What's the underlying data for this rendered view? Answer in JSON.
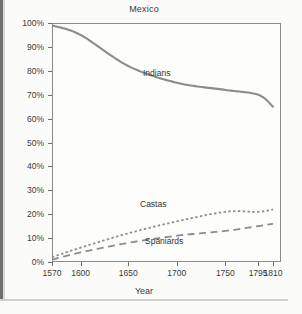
{
  "chart_data": {
    "type": "line",
    "title": "Mexico",
    "xlabel": "Year",
    "ylabel": "",
    "grid": false,
    "legend_position": "inline-annotations",
    "ylim": [
      0,
      100
    ],
    "ytick_labels": [
      "0%",
      "10%",
      "20%",
      "30%",
      "40%",
      "50%",
      "60%",
      "70%",
      "80%",
      "90%",
      "100%"
    ],
    "ytick_values": [
      0,
      10,
      20,
      30,
      40,
      50,
      60,
      70,
      80,
      90,
      100
    ],
    "xtick_labels": [
      "1570",
      "1600",
      "1650",
      "1700",
      "1750",
      "1795",
      "1810"
    ],
    "xtick_values": [
      1570,
      1600,
      1650,
      1700,
      1750,
      1795,
      1810
    ],
    "x": [
      1570,
      1600,
      1650,
      1700,
      1750,
      1795,
      1810
    ],
    "series": [
      {
        "name": "Indians",
        "style": "solid",
        "color": "#8c8c8c",
        "values": [
          99,
          95,
          82,
          75,
          72,
          70,
          65
        ]
      },
      {
        "name": "Castas",
        "style": "dotted",
        "color": "#8c8c8c",
        "values": [
          2,
          6,
          12,
          17,
          21,
          21,
          22
        ]
      },
      {
        "name": "Spaniards",
        "style": "dashed",
        "color": "#8c8c8c",
        "values": [
          1,
          4,
          8,
          11,
          13,
          15,
          16
        ]
      }
    ],
    "annotations": [
      {
        "text": "Indians",
        "x_px": 143,
        "y_px": 68
      },
      {
        "text": "Castas",
        "x_px": 140,
        "y_px": 199
      },
      {
        "text": "Spaniards",
        "x_px": 145,
        "y_px": 236
      }
    ]
  }
}
